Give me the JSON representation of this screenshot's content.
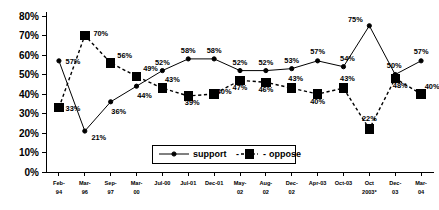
{
  "chart_data": {
    "type": "line",
    "title": "",
    "subtitle": "",
    "xlabel": "",
    "ylabel": "",
    "ylim": [
      0,
      80
    ],
    "ytick_values": [
      80,
      70,
      60,
      50,
      40,
      30,
      20,
      10,
      0
    ],
    "ytick_labels": [
      "80%",
      "70%",
      "60%",
      "50%",
      "40%",
      "30%",
      "20%",
      "10%",
      "0%"
    ],
    "grid": false,
    "legend_position": "inside-bottom-center",
    "categories": [
      "Feb-94",
      "Mar-96",
      "Sep-97",
      "Mar-00",
      "Jul-00",
      "Jul-01",
      "Dec-01",
      "May-02",
      "Aug-02",
      "Dec-02",
      "Apr-03",
      "Oct-03",
      "Oct 2003*",
      "Dec-03",
      "Mar-04"
    ],
    "category_lines": [
      [
        "Feb-",
        "94"
      ],
      [
        "Mar-",
        "96"
      ],
      [
        "Sep-",
        "97"
      ],
      [
        "Mar-",
        "00"
      ],
      [
        "Jul-00",
        ""
      ],
      [
        "Jul-01",
        ""
      ],
      [
        "Dec-01",
        ""
      ],
      [
        "May-",
        "02"
      ],
      [
        "Aug-",
        "02"
      ],
      [
        "Dec-",
        "02"
      ],
      [
        "Apr-03",
        ""
      ],
      [
        "Oct-03",
        ""
      ],
      [
        "Oct",
        "2003*"
      ],
      [
        "Dec-",
        "03"
      ],
      [
        "Mar-",
        "04"
      ]
    ],
    "series": [
      {
        "name": "support",
        "marker": "circle",
        "linestyle": "solid",
        "values": [
          57,
          21,
          36,
          44,
          52,
          58,
          58,
          52,
          52,
          53,
          57,
          54,
          75,
          50,
          57
        ],
        "labels": [
          "57%",
          "21%",
          "36%",
          "44%",
          "52%",
          "58%",
          "58%",
          "52%",
          "52%",
          "53%",
          "57%",
          "54%",
          "75%",
          "50%",
          "57%"
        ],
        "label_offsets": [
          [
            14,
            3
          ],
          [
            14,
            9
          ],
          [
            8,
            12
          ],
          [
            8,
            12
          ],
          [
            0,
            -6
          ],
          [
            0,
            -6
          ],
          [
            0,
            -6
          ],
          [
            0,
            -6
          ],
          [
            0,
            -6
          ],
          [
            0,
            -6
          ],
          [
            0,
            -7
          ],
          [
            4,
            -6
          ],
          [
            -14,
            -4
          ],
          [
            -1,
            -7
          ],
          [
            0,
            -7
          ]
        ]
      },
      {
        "name": "oppose",
        "marker": "square",
        "linestyle": "dashed",
        "values": [
          33,
          70,
          56,
          49,
          43,
          39,
          40,
          47,
          46,
          43,
          40,
          43,
          22,
          48,
          40
        ],
        "labels": [
          "33%",
          "70%",
          "56%",
          "49%",
          "43%",
          "39%",
          "40%",
          "47%",
          "46%",
          "43%",
          "40%",
          "43%",
          "22%",
          "48%",
          "40%"
        ],
        "label_offsets": [
          [
            14,
            3
          ],
          [
            16,
            0
          ],
          [
            14,
            -5
          ],
          [
            14,
            -5
          ],
          [
            10,
            -6
          ],
          [
            4,
            9
          ],
          [
            10,
            0
          ],
          [
            0,
            10
          ],
          [
            0,
            10
          ],
          [
            4,
            -7
          ],
          [
            0,
            10
          ],
          [
            4,
            -7
          ],
          [
            0,
            -8
          ],
          [
            5,
            10
          ],
          [
            11,
            -5
          ]
        ]
      }
    ]
  },
  "legend": {
    "entries": [
      {
        "label": "support",
        "marker": "circle",
        "style": "solid"
      },
      {
        "label": "oppose",
        "marker": "square",
        "style": "dashed"
      }
    ],
    "separator": "-",
    "prefix_dash": "-"
  },
  "colors": {
    "line": "#000000",
    "marker": "#000000",
    "background": "#ffffff",
    "text": "#000000"
  }
}
